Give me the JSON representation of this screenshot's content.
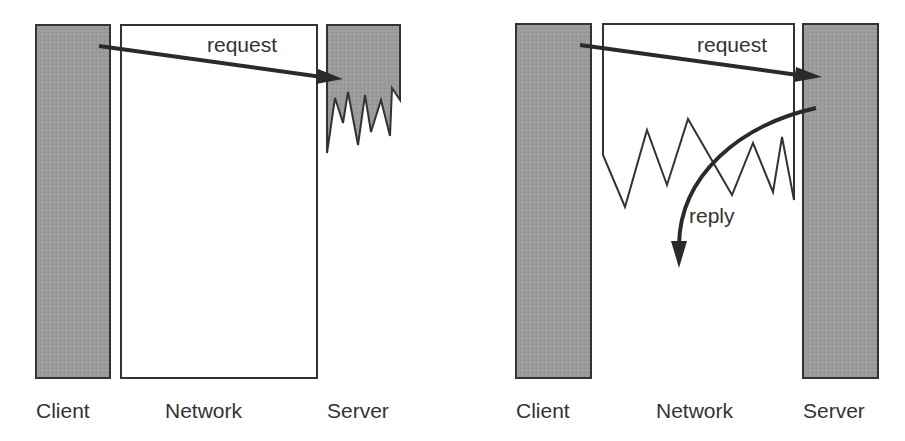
{
  "figure": {
    "panels": [
      {
        "id": "left",
        "description": "request lost: server crashes before processing",
        "columns": [
          {
            "label": "Client"
          },
          {
            "label": "Network"
          },
          {
            "label": "Server"
          }
        ],
        "arrows": [
          {
            "label": "request",
            "from": "Client",
            "to": "Server"
          }
        ],
        "server_state": "crashed"
      },
      {
        "id": "right",
        "description": "reply lost: network fails after server processes request",
        "columns": [
          {
            "label": "Client"
          },
          {
            "label": "Network"
          },
          {
            "label": "Server"
          }
        ],
        "arrows": [
          {
            "label": "request",
            "from": "Client",
            "to": "Server"
          },
          {
            "label": "reply",
            "from": "Server",
            "to": "Client"
          }
        ],
        "network_state": "broken"
      }
    ]
  },
  "colors": {
    "box_fill": "#9a9a9a",
    "outline": "#333333",
    "arrow": "#2a2a2a",
    "text": "#333333"
  }
}
